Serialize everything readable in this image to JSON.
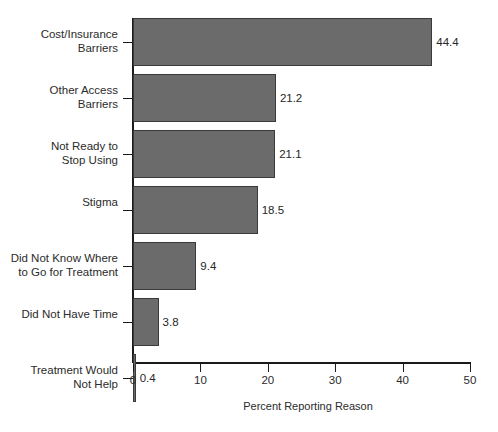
{
  "chart_data": {
    "type": "bar",
    "orientation": "horizontal",
    "title": "",
    "xlabel": "Percent Reporting Reason",
    "ylabel": "",
    "xlim": [
      0,
      50
    ],
    "xticks": [
      0,
      10,
      20,
      30,
      40,
      50
    ],
    "xtick_labels": [
      "0",
      "10",
      "20",
      "30",
      "40",
      "50"
    ],
    "grid": false,
    "legend": null,
    "bar_color": "#6b6b6b",
    "bar_edge_color": "#3a3a3a",
    "axis_color": "#1a1a1a",
    "background_color": "#ffffff",
    "categories": [
      "Cost/Insurance\nBarriers",
      "Other Access\nBarriers",
      "Not Ready to\nStop Using",
      "Stigma",
      "Did Not Know Where\nto Go for Treatment",
      "Did Not Have Time",
      "Treatment Would\nNot Help"
    ],
    "values": [
      44.4,
      21.2,
      21.1,
      18.5,
      9.4,
      3.8,
      0.4
    ],
    "value_labels": [
      "44.4",
      "21.2",
      "21.1",
      "18.5",
      "9.4",
      "3.8",
      "0.4"
    ]
  }
}
